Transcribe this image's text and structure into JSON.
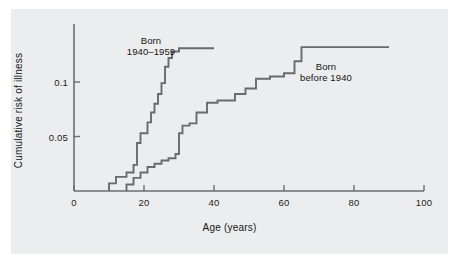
{
  "chart_data": {
    "type": "line",
    "title": "",
    "xlabel": "Age (years)",
    "ylabel": "Cumulative risk of illness",
    "xlim": [
      0,
      100
    ],
    "ylim": [
      0,
      0.145
    ],
    "xticks": [
      0,
      20,
      40,
      60,
      80,
      100
    ],
    "xticklabels": [
      "0",
      "20",
      "40",
      "60",
      "80",
      "100"
    ],
    "yticks": [
      0.05,
      0.1
    ],
    "yticklabels": [
      "0.05",
      "0.1"
    ],
    "grid": false,
    "legend": "inline-annotations",
    "line_color": "#6a6a6a",
    "background_color": "#ecedee",
    "series": [
      {
        "name": "Born 1940–1959",
        "label_line1": "Born",
        "label_line2": "1940–1959",
        "label_x": 22,
        "label_y": 0.137,
        "step": "post",
        "x": [
          10,
          10,
          12,
          12,
          15,
          15,
          17,
          17,
          18,
          18,
          19,
          19,
          21,
          21,
          22,
          22,
          23,
          23,
          24,
          24,
          25,
          25,
          26,
          26,
          27,
          27,
          28,
          28,
          30,
          30,
          40
        ],
        "y": [
          0.0,
          0.007,
          0.007,
          0.013,
          0.013,
          0.017,
          0.017,
          0.024,
          0.024,
          0.044,
          0.044,
          0.053,
          0.053,
          0.063,
          0.063,
          0.072,
          0.072,
          0.08,
          0.08,
          0.089,
          0.089,
          0.099,
          0.099,
          0.114,
          0.114,
          0.122,
          0.122,
          0.128,
          0.128,
          0.131,
          0.131
        ]
      },
      {
        "name": "Born before 1940",
        "label_line1": "Born",
        "label_line2": "before 1940",
        "label_x": 72,
        "label_y": 0.113,
        "step": "post",
        "x": [
          15,
          15,
          17,
          17,
          19,
          19,
          21,
          21,
          23,
          23,
          25,
          25,
          27,
          27,
          29,
          29,
          30,
          30,
          31,
          31,
          33,
          33,
          35,
          35,
          38,
          38,
          41,
          41,
          46,
          46,
          49,
          49,
          52,
          52,
          56,
          56,
          60,
          60,
          63,
          63,
          65,
          65,
          90
        ],
        "y": [
          0.0,
          0.006,
          0.006,
          0.012,
          0.012,
          0.017,
          0.017,
          0.022,
          0.022,
          0.025,
          0.025,
          0.028,
          0.028,
          0.03,
          0.03,
          0.034,
          0.034,
          0.053,
          0.053,
          0.06,
          0.06,
          0.062,
          0.062,
          0.072,
          0.072,
          0.081,
          0.081,
          0.083,
          0.083,
          0.089,
          0.089,
          0.094,
          0.094,
          0.103,
          0.103,
          0.105,
          0.105,
          0.108,
          0.108,
          0.119,
          0.119,
          0.132,
          0.132
        ]
      }
    ]
  }
}
